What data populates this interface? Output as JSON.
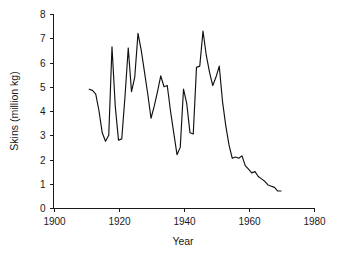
{
  "chart_data": {
    "type": "line",
    "title": "",
    "subtitle": "",
    "xlabel": "Year",
    "ylabel": "Skins (million kg)",
    "xlim": [
      1900,
      1980
    ],
    "ylim": [
      0,
      8
    ],
    "xticks": [
      1900,
      1920,
      1940,
      1960,
      1980
    ],
    "xtick_labels": [
      "1900",
      "1920",
      "1940",
      "1960",
      "1980"
    ],
    "yticks": [
      0,
      1,
      2,
      3,
      4,
      5,
      6,
      7,
      8
    ],
    "ytick_labels": [
      "0",
      "1",
      "2",
      "3",
      "4",
      "5",
      "6",
      "7",
      "8"
    ],
    "grid": false,
    "legend": false,
    "legend_position": "none",
    "line_color": "#111111",
    "series": [
      {
        "name": "Skins",
        "x": [
          1911,
          1912,
          1913,
          1914,
          1915,
          1916,
          1917,
          1918,
          1919,
          1920,
          1921,
          1922,
          1923,
          1924,
          1925,
          1926,
          1927,
          1928,
          1929,
          1930,
          1931,
          1932,
          1933,
          1934,
          1935,
          1936,
          1937,
          1938,
          1939,
          1940,
          1941,
          1942,
          1943,
          1944,
          1945,
          1946,
          1947,
          1948,
          1949,
          1950,
          1951,
          1952,
          1953,
          1954,
          1955,
          1956,
          1957,
          1958,
          1959,
          1960,
          1961,
          1962,
          1963,
          1964,
          1965,
          1966,
          1967,
          1968,
          1969,
          1970
        ],
        "values": [
          4.9,
          4.85,
          4.7,
          4.0,
          3.1,
          2.75,
          3.0,
          6.65,
          4.2,
          2.8,
          2.85,
          4.6,
          6.6,
          4.8,
          5.4,
          7.2,
          6.5,
          5.6,
          4.7,
          3.7,
          4.2,
          4.8,
          5.45,
          5.0,
          5.05,
          4.0,
          3.1,
          2.2,
          2.5,
          4.9,
          4.3,
          3.1,
          3.05,
          5.8,
          5.85,
          7.3,
          6.3,
          5.6,
          5.05,
          5.4,
          5.85,
          4.4,
          3.4,
          2.6,
          2.05,
          2.1,
          2.05,
          2.15,
          1.75,
          1.6,
          1.45,
          1.5,
          1.3,
          1.2,
          1.1,
          0.95,
          0.9,
          0.85,
          0.7,
          0.7
        ]
      }
    ]
  },
  "axes": {
    "x_axis_name": "year-axis",
    "y_axis_name": "skins-axis"
  }
}
